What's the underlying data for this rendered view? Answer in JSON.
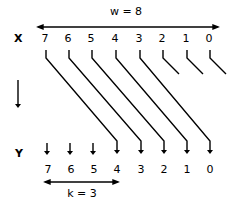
{
  "diagram": {
    "top_label": "w = 8",
    "bottom_label": "k = 3",
    "row_x_label": "X",
    "row_y_label": "Y",
    "x_digits": [
      "7",
      "6",
      "5",
      "4",
      "3",
      "2",
      "1",
      "0"
    ],
    "y_digits": [
      "7",
      "6",
      "5",
      "4",
      "3",
      "2",
      "1",
      "0"
    ],
    "shift_amount": 3,
    "dropped_bits": [
      "2",
      "1",
      "0"
    ],
    "zero_fill_bits": [
      "7",
      "6",
      "5"
    ],
    "colors": {
      "ink": "#000000",
      "background": "#ffffff"
    }
  }
}
